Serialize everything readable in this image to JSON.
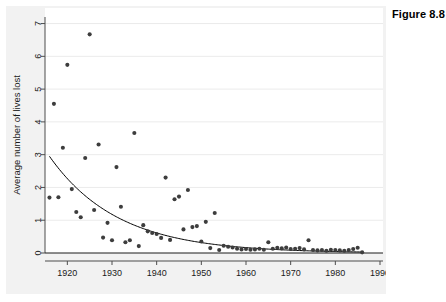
{
  "caption": "Figure 8.8",
  "chart_data": {
    "type": "scatter",
    "title": "",
    "xlabel": "",
    "ylabel": "Average number of lives lost",
    "xlim": [
      1915,
      1990
    ],
    "ylim": [
      0,
      7.2
    ],
    "xticks": [
      1920,
      1930,
      1940,
      1950,
      1960,
      1970,
      1980,
      1990
    ],
    "xtick_labels": [
      "1920",
      "1930",
      "1940",
      "1950",
      "1960",
      "1970",
      "1980",
      "1990"
    ],
    "yticks": [
      0,
      1,
      2,
      3,
      4,
      5,
      6,
      7
    ],
    "ytick_labels": [
      "0",
      "1",
      "2",
      "3",
      "4",
      "5",
      "6",
      "7"
    ],
    "grid": "horizontal",
    "legend": "none",
    "marker_color": "#3d3d3d",
    "fit_line_color": "#000000",
    "panel_background": "#f2f2f2",
    "plot_background": "#ffffff",
    "series": [
      {
        "name": "Average number of lives lost",
        "marker": "filled-circle",
        "points": [
          [
            1916,
            1.69
          ],
          [
            1917,
            4.55
          ],
          [
            1918,
            1.7
          ],
          [
            1919,
            3.21
          ],
          [
            1920,
            5.74
          ],
          [
            1921,
            1.95
          ],
          [
            1922,
            1.25
          ],
          [
            1923,
            1.09
          ],
          [
            1924,
            2.9
          ],
          [
            1925,
            6.67
          ],
          [
            1926,
            1.31
          ],
          [
            1927,
            3.31
          ],
          [
            1928,
            0.47
          ],
          [
            1929,
            0.92
          ],
          [
            1930,
            0.39
          ],
          [
            1931,
            2.62
          ],
          [
            1932,
            1.41
          ],
          [
            1933,
            0.33
          ],
          [
            1934,
            0.39
          ],
          [
            1935,
            3.66
          ],
          [
            1936,
            0.21
          ],
          [
            1937,
            0.85
          ],
          [
            1938,
            0.66
          ],
          [
            1939,
            0.61
          ],
          [
            1940,
            0.58
          ],
          [
            1941,
            0.46
          ],
          [
            1942,
            2.3
          ],
          [
            1943,
            0.4
          ],
          [
            1944,
            1.64
          ],
          [
            1945,
            1.72
          ],
          [
            1946,
            0.72
          ],
          [
            1947,
            1.92
          ],
          [
            1948,
            0.79
          ],
          [
            1949,
            0.82
          ],
          [
            1950,
            0.35
          ],
          [
            1951,
            0.95
          ],
          [
            1952,
            0.15
          ],
          [
            1953,
            1.22
          ],
          [
            1954,
            0.09
          ],
          [
            1955,
            0.22
          ],
          [
            1956,
            0.19
          ],
          [
            1957,
            0.17
          ],
          [
            1958,
            0.13
          ],
          [
            1959,
            0.11
          ],
          [
            1960,
            0.12
          ],
          [
            1961,
            0.1
          ],
          [
            1962,
            0.11
          ],
          [
            1963,
            0.13
          ],
          [
            1964,
            0.1
          ],
          [
            1965,
            0.33
          ],
          [
            1966,
            0.13
          ],
          [
            1967,
            0.16
          ],
          [
            1968,
            0.14
          ],
          [
            1969,
            0.17
          ],
          [
            1970,
            0.12
          ],
          [
            1971,
            0.13
          ],
          [
            1972,
            0.15
          ],
          [
            1973,
            0.11
          ],
          [
            1974,
            0.39
          ],
          [
            1975,
            0.09
          ],
          [
            1976,
            0.08
          ],
          [
            1977,
            0.09
          ],
          [
            1978,
            0.07
          ],
          [
            1979,
            0.1
          ],
          [
            1980,
            0.09
          ],
          [
            1981,
            0.08
          ],
          [
            1982,
            0.07
          ],
          [
            1983,
            0.09
          ],
          [
            1984,
            0.12
          ],
          [
            1985,
            0.16
          ],
          [
            1986,
            0.02
          ]
        ]
      }
    ],
    "fit_curve": {
      "name": "exponential decay fit",
      "description": "y = 2.95 * exp(-0.0775 * (x - 1916))",
      "x_start": 1916,
      "x_end": 1986,
      "y_start": 2.95,
      "y_end": 0.03
    }
  }
}
